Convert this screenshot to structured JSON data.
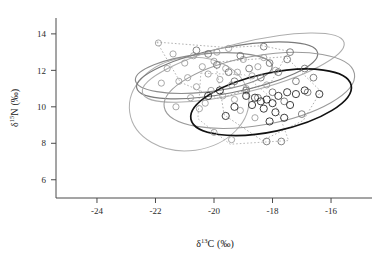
{
  "figure": {
    "name": "stable-isotope-biplot",
    "background_color": "#ffffff"
  },
  "axes": {
    "x": {
      "title_delta": "δ",
      "title_sup": "13",
      "title_element": "C",
      "title_units": "(‰)",
      "title_full": "δ 13C (‰)",
      "ticks": [
        "-24",
        "-22",
        "-20",
        "-18",
        "-16"
      ],
      "tick_values": [
        -24,
        -22,
        -20,
        -18,
        -16
      ],
      "range": [
        -25.4,
        -14.6
      ]
    },
    "y": {
      "title_delta": "δ",
      "title_sup": "15",
      "title_element": "N",
      "title_units": "(‰)",
      "title_full": "δ 15N (‰)",
      "ticks": [
        "6",
        "8",
        "10",
        "12",
        "14"
      ],
      "tick_values": [
        6,
        8,
        10,
        12,
        14
      ],
      "range": [
        5.0,
        15.2
      ]
    }
  },
  "chart_data": {
    "type": "scatter",
    "title": "",
    "subtitle": "",
    "xlabel": "δ 13C (‰)",
    "ylabel": "δ 15N (‰)",
    "xlim": [
      -25.4,
      -14.6
    ],
    "ylim": [
      5.0,
      15.2
    ],
    "grid": false,
    "legend": "none",
    "series": [
      {
        "name": "group-a-light-gray",
        "marker": "open-circle",
        "color": "#9a9a9a",
        "marker_size": 3.1,
        "points": [
          [
            -21.9,
            13.5
          ],
          [
            -21.4,
            12.9
          ],
          [
            -21.0,
            12.4
          ],
          [
            -20.7,
            12.8
          ],
          [
            -20.4,
            12.2
          ],
          [
            -20.2,
            11.8
          ],
          [
            -20.0,
            12.5
          ],
          [
            -19.8,
            11.5
          ],
          [
            -19.6,
            12.1
          ],
          [
            -19.4,
            11.2
          ],
          [
            -19.2,
            11.9
          ],
          [
            -19.0,
            12.6
          ],
          [
            -20.6,
            11.1
          ],
          [
            -20.9,
            11.6
          ],
          [
            -21.2,
            11.4
          ],
          [
            -20.1,
            10.9
          ],
          [
            -19.7,
            10.6
          ],
          [
            -19.3,
            10.4
          ],
          [
            -20.3,
            10.2
          ],
          [
            -20.8,
            10.5
          ],
          [
            -19.9,
            13.0
          ],
          [
            -19.5,
            13.2
          ],
          [
            -18.9,
            11.0
          ],
          [
            -18.7,
            11.7
          ],
          [
            -18.5,
            12.2
          ],
          [
            -18.3,
            12.7
          ],
          [
            -21.6,
            12.1
          ],
          [
            -21.8,
            11.3
          ],
          [
            -20.5,
            9.9
          ],
          [
            -19.1,
            9.8
          ],
          [
            -18.2,
            11.2
          ],
          [
            -17.9,
            12.0
          ],
          [
            -21.3,
            10.0
          ],
          [
            -20.0,
            8.6
          ],
          [
            -19.4,
            8.2
          ],
          [
            -18.6,
            9.4
          ]
        ]
      },
      {
        "name": "group-b-medium-gray",
        "marker": "open-circle",
        "color": "#6e6e6e",
        "marker_size": 3.4,
        "points": [
          [
            -19.9,
            12.3
          ],
          [
            -19.5,
            11.9
          ],
          [
            -19.1,
            12.8
          ],
          [
            -18.8,
            12.1
          ],
          [
            -18.4,
            11.6
          ],
          [
            -18.1,
            12.4
          ],
          [
            -17.8,
            11.9
          ],
          [
            -17.5,
            12.6
          ],
          [
            -19.3,
            11.4
          ],
          [
            -18.9,
            10.9
          ],
          [
            -18.5,
            10.5
          ],
          [
            -18.0,
            10.8
          ],
          [
            -17.6,
            10.3
          ],
          [
            -17.2,
            11.4
          ],
          [
            -16.9,
            12.1
          ],
          [
            -16.6,
            11.6
          ],
          [
            -20.2,
            12.9
          ],
          [
            -20.6,
            13.1
          ],
          [
            -17.4,
            13.0
          ],
          [
            -16.8,
            10.8
          ],
          [
            -18.3,
            13.3
          ],
          [
            -17.0,
            9.6
          ],
          [
            -17.7,
            8.1
          ],
          [
            -18.2,
            8.1
          ]
        ]
      },
      {
        "name": "group-c-dark",
        "marker": "open-circle",
        "color": "#1f1f1f",
        "marker_size": 3.6,
        "points": [
          [
            -18.9,
            10.6
          ],
          [
            -18.6,
            10.5
          ],
          [
            -18.4,
            10.3
          ],
          [
            -18.2,
            10.4
          ],
          [
            -18.0,
            10.2
          ],
          [
            -17.8,
            10.6
          ],
          [
            -17.5,
            10.8
          ],
          [
            -17.2,
            10.7
          ],
          [
            -16.9,
            10.9
          ],
          [
            -18.7,
            10.1
          ],
          [
            -18.3,
            9.9
          ],
          [
            -17.9,
            9.7
          ],
          [
            -17.4,
            10.1
          ],
          [
            -19.3,
            10.0
          ],
          [
            -19.6,
            9.5
          ],
          [
            -18.1,
            9.2
          ],
          [
            -17.6,
            9.4
          ],
          [
            -16.4,
            10.7
          ],
          [
            -19.8,
            10.9
          ],
          [
            -20.2,
            10.6
          ]
        ]
      }
    ],
    "ellipses": [
      {
        "name": "ellipse-light-gray-large-left",
        "cx": -20.85,
        "cy": 10.15,
        "rx": 2.05,
        "ry": 2.55,
        "rotation_deg": -8,
        "color": "#b0b0b0",
        "stroke_width": 1.0,
        "style": "solid"
      },
      {
        "name": "ellipse-gray-mid-upper",
        "cx": -20.35,
        "cy": 11.85,
        "rx": 2.35,
        "ry": 1.05,
        "rotation_deg": -6,
        "color": "#8c8c8c",
        "stroke_width": 1.2,
        "style": "solid"
      },
      {
        "name": "ellipse-gray-wide-upper",
        "cx": -19.55,
        "cy": 12.0,
        "rx": 3.15,
        "ry": 1.25,
        "rotation_deg": -11,
        "color": "#7a7a7a",
        "stroke_width": 1.2,
        "style": "solid"
      },
      {
        "name": "ellipse-light-gray-wide-top",
        "cx": -19.0,
        "cy": 12.15,
        "rx": 3.55,
        "ry": 1.35,
        "rotation_deg": -14,
        "color": "#adadad",
        "stroke_width": 1.1,
        "style": "solid"
      },
      {
        "name": "ellipse-gray-right-lower",
        "cx": -18.45,
        "cy": 10.9,
        "rx": 3.3,
        "ry": 1.9,
        "rotation_deg": -10,
        "color": "#9b9b9b",
        "stroke_width": 1.1,
        "style": "solid"
      },
      {
        "name": "ellipse-black-right",
        "cx": -18.05,
        "cy": 10.25,
        "rx": 2.8,
        "ry": 1.6,
        "rotation_deg": -12,
        "color": "#111111",
        "stroke_width": 1.7,
        "style": "solid"
      }
    ],
    "hulls": [
      {
        "name": "hull-dashed-upper-left",
        "color": "#9f9f9f",
        "style": "dashed",
        "vertices": [
          [
            -21.95,
            13.55
          ],
          [
            -19.55,
            13.25
          ],
          [
            -18.35,
            13.35
          ],
          [
            -17.45,
            13.05
          ],
          [
            -18.05,
            11.35
          ],
          [
            -19.85,
            10.45
          ],
          [
            -21.15,
            11.35
          ]
        ]
      },
      {
        "name": "hull-dashed-lower-left",
        "color": "#a8a8a8",
        "style": "dashed",
        "vertices": [
          [
            -20.45,
            11.85
          ],
          [
            -18.95,
            11.75
          ],
          [
            -17.95,
            10.35
          ],
          [
            -17.45,
            8.15
          ],
          [
            -19.45,
            7.95
          ],
          [
            -20.55,
            9.35
          ]
        ]
      },
      {
        "name": "hull-dashed-right",
        "color": "#9a9a9a",
        "style": "dashed",
        "vertices": [
          [
            -19.95,
            12.45
          ],
          [
            -17.55,
            12.75
          ],
          [
            -16.35,
            10.85
          ],
          [
            -16.95,
            9.25
          ],
          [
            -18.35,
            8.15
          ],
          [
            -19.65,
            9.55
          ]
        ]
      }
    ]
  }
}
